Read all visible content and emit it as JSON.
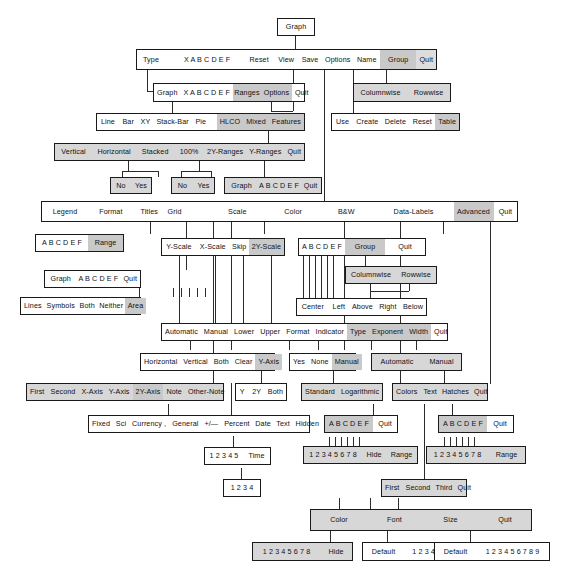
{
  "diagram": {
    "root": "Graph",
    "colors": {
      "line": "#2b2b2b",
      "border": "#1a1a1a",
      "box_fill": "#ffffff",
      "shaded_fill": "#d7d7d7",
      "highlight_fill": "#c9c9c9"
    }
  },
  "nodes": {
    "root": {
      "items": [
        "Graph"
      ]
    },
    "main_menu": {
      "items": [
        "Type",
        "X A B C D E F",
        "Reset",
        "View",
        "Save",
        "Options",
        "Name",
        "Group",
        "Quit"
      ],
      "highlighted": [
        "Group"
      ]
    },
    "group_menu": {
      "items": [
        "Columnwise",
        "Rowwise"
      ]
    },
    "name_menu": {
      "items": [
        "Use",
        "Create",
        "Delete",
        "Reset",
        "Table"
      ],
      "highlighted": [
        "Table"
      ]
    },
    "type_menu": {
      "items": [
        "Graph",
        "X A B C D E F",
        "Ranges",
        "Options",
        "Quit"
      ],
      "highlighted": [
        "Ranges",
        "Options"
      ]
    },
    "graph_types": {
      "items": [
        "Line",
        "Bar",
        "XY",
        "Stack-Bar",
        "Pie",
        "HLCO",
        "Mixed",
        "Features"
      ],
      "highlighted": [
        "HLCO",
        "Mixed",
        "Features"
      ]
    },
    "ranges_menu": {
      "items": [
        "Vertical",
        "Horizontal",
        "Stacked",
        "100%",
        "2Y-Ranges",
        "Y-Ranges",
        "Quit"
      ]
    },
    "noyes_1": {
      "items": [
        "No",
        "Yes"
      ]
    },
    "noyes_2": {
      "items": [
        "No",
        "Yes"
      ]
    },
    "yranges_menu": {
      "items": [
        "Graph",
        "A B C D E F",
        "Quit"
      ]
    },
    "options_menu": {
      "items": [
        "Legend",
        "Format",
        "Titles",
        "Grid",
        "Scale",
        "Color",
        "B&W",
        "Data-Labels",
        "Advanced",
        "Quit"
      ],
      "highlighted": [
        "Advanced"
      ]
    },
    "legend_menu": {
      "items": [
        "A B C D E F",
        "Range"
      ],
      "highlighted": [
        "Range"
      ]
    },
    "format_menu": {
      "items": [
        "Graph",
        "A B C D E F",
        "Quit"
      ]
    },
    "format_styles": {
      "items": [
        "Lines",
        "Symbols",
        "Both",
        "Neither",
        "Area"
      ],
      "highlighted": [
        "Area"
      ]
    },
    "scale_menu": {
      "items": [
        "Y-Scale",
        "X-Scale",
        "Skip",
        "2Y-Scale"
      ],
      "highlighted": [
        "2Y-Scale"
      ]
    },
    "datalabels_menu": {
      "items": [
        "A B C D E F",
        "Group",
        "Quit"
      ],
      "highlighted": [
        "Group"
      ]
    },
    "datalabels_group": {
      "items": [
        "Columnwise",
        "Rowwise"
      ]
    },
    "datalabels_pos": {
      "items": [
        "Center",
        "Left",
        "Above",
        "Right",
        "Below"
      ]
    },
    "scale_settings": {
      "items": [
        "Automatic",
        "Manual",
        "Lower",
        "Upper",
        "Format",
        "Indicator",
        "Type",
        "Exponent",
        "Width",
        "Quit"
      ],
      "highlighted": [
        "Type",
        "Exponent",
        "Width"
      ]
    },
    "grid_menu": {
      "items": [
        "Horizontal",
        "Vertical",
        "Both",
        "Clear",
        "Y-Axis"
      ],
      "highlighted": [
        "Y-Axis"
      ]
    },
    "indicator_menu": {
      "items": [
        "Yes",
        "None",
        "Manual"
      ],
      "highlighted": [
        "Manual"
      ]
    },
    "exponent_menu": {
      "items": [
        "Automatic",
        "Manual"
      ]
    },
    "titles_menu": {
      "items": [
        "First",
        "Second",
        "X-Axis",
        "Y-Axis",
        "2Y-Axis",
        "Note",
        "Other-Note"
      ],
      "highlighted": [
        "2Y-Axis"
      ]
    },
    "grid_yaxis_menu": {
      "items": [
        "Y",
        "2Y",
        "Both"
      ]
    },
    "scale_type_menu": {
      "items": [
        "Standard",
        "Logarithmic"
      ]
    },
    "color_menu": {
      "items": [
        "Colors",
        "Text",
        "Hatches",
        "Quit"
      ]
    },
    "format_types": {
      "items": [
        "Fixed",
        "Sci",
        "Currency ,",
        "General",
        "+/—",
        "Percent",
        "Date",
        "Text",
        "Hidden"
      ]
    },
    "date_menu": {
      "items": [
        "1 2 3 4 5",
        "Time"
      ]
    },
    "time_menu": {
      "items": [
        "1 2 3 4"
      ]
    },
    "colors_abc": {
      "items": [
        "A B C D E F",
        "Quit"
      ],
      "highlighted": [
        "A B C D E F"
      ]
    },
    "colors_numbers": {
      "items": [
        "1 2 3 4 5 6 7 8",
        "Hide",
        "Range"
      ]
    },
    "hatches_abc": {
      "items": [
        "A B C D E F",
        "Quit"
      ],
      "highlighted": [
        "A B C D E F"
      ]
    },
    "hatches_numbers": {
      "items": [
        "1 2 3 4 5 6 7 8",
        "Range"
      ]
    },
    "text_menu": {
      "items": [
        "First",
        "Second",
        "Third",
        "Quit"
      ]
    },
    "text_attrs": {
      "items": [
        "Color",
        "Font",
        "Size",
        "Quit"
      ]
    },
    "text_color": {
      "items": [
        "1 2 3 4 5 6 7 8",
        "Hide"
      ]
    },
    "text_font": {
      "items": [
        "Default",
        "1 2 3 4 5 6 7 8"
      ]
    },
    "text_size": {
      "items": [
        "Default",
        "1 2 3 4 5 6 7 8 9"
      ]
    }
  }
}
